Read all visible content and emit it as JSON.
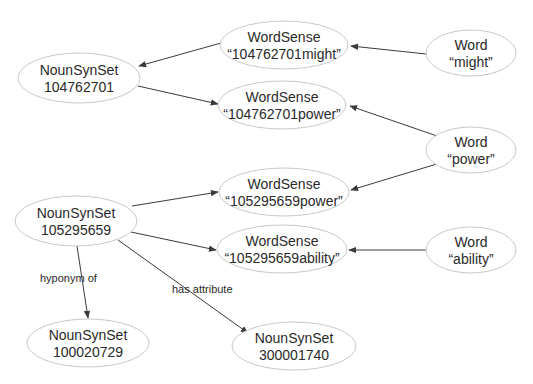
{
  "diagram": {
    "type": "directed-graph",
    "colors": {
      "background": "#ffffff",
      "node_border": "#c8c8c8",
      "edge": "#3a3a3a",
      "text": "#2a2a2a"
    },
    "nodes": [
      {
        "id": "ns104762701",
        "type": "NounSynSet",
        "line1": "NounSynSet",
        "line2": "104762701",
        "cx": 79,
        "cy": 78,
        "rx": 61,
        "ry": 25
      },
      {
        "id": "ws_might",
        "type": "WordSense",
        "line1": "WordSense",
        "line2": "“104762701might”",
        "cx": 284,
        "cy": 45,
        "rx": 64,
        "ry": 24
      },
      {
        "id": "ws_104power",
        "type": "WordSense",
        "line1": "WordSense",
        "line2": "“104762701power”",
        "cx": 282,
        "cy": 105,
        "rx": 64,
        "ry": 24
      },
      {
        "id": "w_might",
        "type": "Word",
        "line1": "Word",
        "line2": "“might”",
        "cx": 471,
        "cy": 53,
        "rx": 45,
        "ry": 23
      },
      {
        "id": "w_power",
        "type": "Word",
        "line1": "Word",
        "line2": "“power”",
        "cx": 471,
        "cy": 150,
        "rx": 45,
        "ry": 23
      },
      {
        "id": "ns105295659",
        "type": "NounSynSet",
        "line1": "NounSynSet",
        "line2": "105295659",
        "cx": 76,
        "cy": 221,
        "rx": 61,
        "ry": 25
      },
      {
        "id": "ws_105power",
        "type": "WordSense",
        "line1": "WordSense",
        "line2": "“105295659power”",
        "cx": 284,
        "cy": 192,
        "rx": 65,
        "ry": 24
      },
      {
        "id": "ws_ability",
        "type": "WordSense",
        "line1": "WordSense",
        "line2": "“105295659ability”",
        "cx": 282,
        "cy": 249,
        "rx": 65,
        "ry": 24
      },
      {
        "id": "w_ability",
        "type": "Word",
        "line1": "Word",
        "line2": "“ability”",
        "cx": 471,
        "cy": 250,
        "rx": 45,
        "ry": 23
      },
      {
        "id": "ns100020729",
        "type": "NounSynSet",
        "line1": "NounSynSet",
        "line2": "100020729",
        "cx": 88,
        "cy": 343,
        "rx": 61,
        "ry": 24
      },
      {
        "id": "ns300001740",
        "type": "NounSynSet",
        "line1": "NounSynSet",
        "line2": "300001740",
        "cx": 294,
        "cy": 346,
        "rx": 62,
        "ry": 24
      }
    ],
    "edges": [
      {
        "from": "ws_might",
        "to": "ns104762701",
        "label": "",
        "x1": 221,
        "y1": 43,
        "x2": 139,
        "y2": 66
      },
      {
        "from": "w_might",
        "to": "ws_might",
        "label": "",
        "x1": 426,
        "y1": 54,
        "x2": 351,
        "y2": 46
      },
      {
        "from": "ns104762701",
        "to": "ws_104power",
        "label": "",
        "x1": 138,
        "y1": 86,
        "x2": 218,
        "y2": 104
      },
      {
        "from": "w_power",
        "to": "ws_104power",
        "label": "",
        "x1": 440,
        "y1": 137,
        "x2": 350,
        "y2": 106
      },
      {
        "from": "w_power",
        "to": "ws_105power",
        "label": "",
        "x1": 440,
        "y1": 163,
        "x2": 351,
        "y2": 190
      },
      {
        "from": "ns105295659",
        "to": "ws_105power",
        "label": "",
        "x1": 132,
        "y1": 206,
        "x2": 218,
        "y2": 192
      },
      {
        "from": "ns105295659",
        "to": "ws_ability",
        "label": "",
        "x1": 131,
        "y1": 232,
        "x2": 216,
        "y2": 250
      },
      {
        "from": "w_ability",
        "to": "ws_ability",
        "label": "",
        "x1": 426,
        "y1": 250,
        "x2": 349,
        "y2": 250
      },
      {
        "from": "ns105295659",
        "to": "ns100020729",
        "label": "hyponym of",
        "x1": 77,
        "y1": 246,
        "x2": 88,
        "y2": 318,
        "label_x": 40,
        "label_y": 282
      },
      {
        "from": "ns105295659",
        "to": "ns300001740",
        "label": "has attribute",
        "x1": 118,
        "y1": 240,
        "x2": 248,
        "y2": 333,
        "label_x": 172,
        "label_y": 293
      }
    ]
  }
}
